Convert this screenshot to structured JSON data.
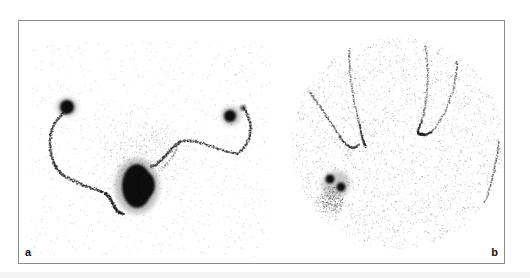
{
  "figure": {
    "panels": [
      {
        "id": "a",
        "label": "a",
        "description": "scintigraphy image with curved tracer path and three hot spots"
      },
      {
        "id": "b",
        "label": "b",
        "description": "circular field-of-view scintigraphy image showing hand outline with focal uptake"
      }
    ],
    "colors": {
      "background": "#ffffff",
      "frame": "#8a8a8a",
      "uptake": "#111111"
    }
  }
}
